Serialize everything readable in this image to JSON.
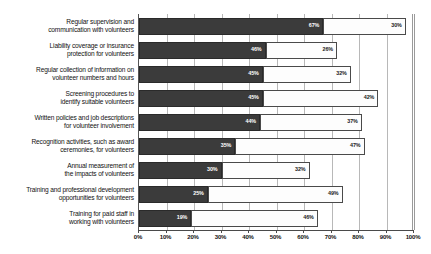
{
  "chart_data": {
    "type": "bar",
    "orientation": "horizontal",
    "stacked": true,
    "title": "",
    "subtitle": "",
    "xlabel": "",
    "ylabel": "",
    "xlim": [
      0,
      100
    ],
    "grid": true,
    "legend_position": "none",
    "xticks": [
      "0%",
      "10%",
      "20%",
      "30%",
      "40%",
      "50%",
      "60%",
      "70%",
      "80%",
      "90%",
      "100%"
    ],
    "xtick_values": [
      0,
      10,
      20,
      30,
      40,
      50,
      60,
      70,
      80,
      90,
      100
    ],
    "categories": [
      "Regular supervision and communication with volunteers",
      "Liability coverage or insurance protection for volunteers",
      "Regular collection of information on volunteer numbers and hours",
      "Screening procedures to identify suitable volunteers",
      "Written policies and job descriptions for volunteer involvement",
      "Recognition activities, such as award ceremonies, for volunteers",
      "Annual measurement of the impacts of volunteers",
      "Training and professional development opportunities for volunteers",
      "Training for paid staff in working with volunteers"
    ],
    "category_lines": [
      [
        "Regular supervision and",
        "communication with volunteers"
      ],
      [
        "Liability coverage or insurance",
        "protection for volunteers"
      ],
      [
        "Regular collection of information on",
        "volunteer numbers and hours"
      ],
      [
        "Screening procedures to",
        "identify suitable volunteers"
      ],
      [
        "Written policies and job descriptions",
        "for volunteer involvement"
      ],
      [
        "Recognition activities, such as award",
        "ceremonies, for volunteers"
      ],
      [
        "Annual measurement of",
        "the impacts of volunteers"
      ],
      [
        "Training and professional development",
        "opportunities for volunteers"
      ],
      [
        "Training for paid staff in",
        "working with volunteers"
      ]
    ],
    "series": [
      {
        "name": "dark",
        "color": "#3b3b3b",
        "values": [
          67,
          46,
          45,
          45,
          44,
          35,
          30,
          25,
          19
        ],
        "labels": [
          "67%",
          "46%",
          "45%",
          "45%",
          "44%",
          "35%",
          "30%",
          "25%",
          "19%"
        ]
      },
      {
        "name": "light",
        "color": "#fdfdfd",
        "values": [
          30,
          26,
          32,
          42,
          37,
          47,
          32,
          49,
          46
        ],
        "labels": [
          "30%",
          "26%",
          "32%",
          "42%",
          "37%",
          "47%",
          "32%",
          "49%",
          "46%"
        ]
      }
    ]
  }
}
